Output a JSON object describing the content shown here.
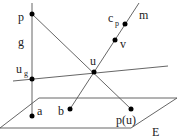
{
  "labels": {
    "p": "p",
    "g": "g",
    "u_g_main": "u",
    "u_g_sub": "g",
    "u": "u",
    "c_p_main": "c",
    "c_p_sub": "p",
    "m": "m",
    "v": "v",
    "a": "a",
    "b": "b",
    "p_u": "p(u)",
    "E": "E"
  },
  "colors": {
    "line": "#555555",
    "point": "#000000"
  }
}
